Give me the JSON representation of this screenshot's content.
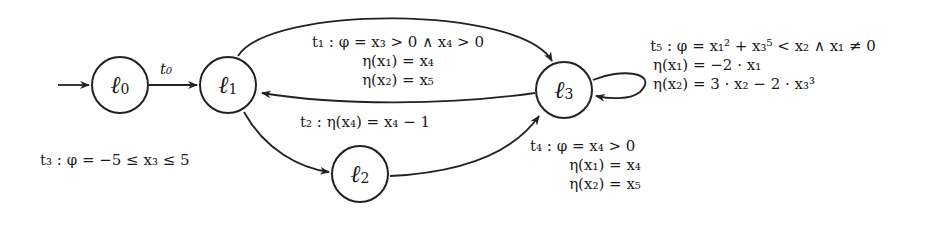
{
  "diagram": {
    "type": "control-flow automaton",
    "nodes": [
      {
        "id": "l0",
        "symbol": "ℓ",
        "index": "0",
        "initial": true
      },
      {
        "id": "l1",
        "symbol": "ℓ",
        "index": "1"
      },
      {
        "id": "l2",
        "symbol": "ℓ",
        "index": "2"
      },
      {
        "id": "l3",
        "symbol": "ℓ",
        "index": "3"
      }
    ],
    "edges": [
      {
        "id": "t0",
        "from": "l0",
        "to": "l1",
        "lines": [
          "t₀"
        ]
      },
      {
        "id": "t1",
        "from": "l1",
        "to": "l3",
        "lines": [
          "t₁ : φ = x₃ > 0 ∧ x₄ > 0",
          "η(x₁) = x₄",
          "η(x₂) = x₅"
        ]
      },
      {
        "id": "t2",
        "from": "l3",
        "to": "l1",
        "lines": [
          "t₂ : η(x₄) = x₄ − 1"
        ]
      },
      {
        "id": "t3",
        "from": "l1",
        "to": "l2",
        "lines": [
          "t₃ : φ = −5 ≤ x₃ ≤ 5"
        ]
      },
      {
        "id": "t4",
        "from": "l2",
        "to": "l3",
        "lines": [
          "t₄ : φ = x₄ > 0",
          "η(x₁) = x₄",
          "η(x₂) = x₅"
        ]
      },
      {
        "id": "t5",
        "from": "l3",
        "to": "l3",
        "lines": [
          "t₅ : φ = x₁² + x₃⁵ < x₂ ∧ x₁ ≠ 0",
          "η(x₁) = −2 · x₁",
          "η(x₂) = 3 · x₂ − 2 · x₃³"
        ]
      }
    ]
  }
}
